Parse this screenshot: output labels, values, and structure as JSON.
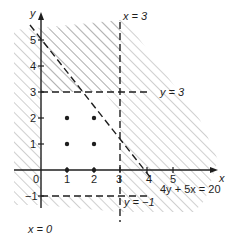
{
  "diagram": {
    "type": "linear-programming-feasible-region",
    "axes": {
      "x_label": "x",
      "y_label": "y",
      "origin_label": "0",
      "x_ticks": [
        "1",
        "2",
        "3",
        "4",
        "5"
      ],
      "y_ticks": [
        "1",
        "2",
        "3",
        "4",
        "5"
      ],
      "y_neg_tick": "−1"
    },
    "lines": {
      "x0": "x  =  0",
      "x3": "x  =  3",
      "y3": "y  =  3",
      "yneg1": "y  =  −1",
      "diag": "4y + 5x  =  20"
    },
    "points": [
      [
        1,
        0
      ],
      [
        2,
        0
      ],
      [
        1,
        1
      ],
      [
        2,
        1
      ],
      [
        1,
        2
      ],
      [
        2,
        2
      ]
    ],
    "shading": "unshaded region is the feasible set; outside is hatched"
  }
}
